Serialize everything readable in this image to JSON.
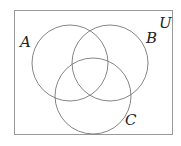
{
  "diagram": {
    "type": "venn",
    "universe": {
      "label": "U",
      "x": 14,
      "y": 10,
      "width": 159,
      "height": 124
    },
    "sets": [
      {
        "label": "A",
        "cx": 70,
        "cy": 63,
        "r": 38,
        "label_x": 20,
        "label_y": 46
      },
      {
        "label": "B",
        "cx": 110,
        "cy": 63,
        "r": 38,
        "label_x": 147,
        "label_y": 42
      },
      {
        "label": "C",
        "cx": 93,
        "cy": 96,
        "r": 38,
        "label_x": 126,
        "label_y": 124
      }
    ],
    "universe_label_pos": {
      "x": 159,
      "y": 28
    },
    "stroke_color": "#777777",
    "border_color": "#999999"
  }
}
